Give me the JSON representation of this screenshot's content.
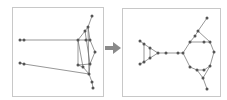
{
  "figure": {
    "colors": {
      "edge": "#6a6a6a",
      "node": "#555555",
      "border": "#c8c8c8",
      "arrow": "#8a8a8a"
    }
  },
  "arrow": {
    "icon": "right-arrow-icon"
  },
  "before": {
    "nodes": [
      {
        "x": 92,
        "y": 16
      },
      {
        "x": 88,
        "y": 27
      },
      {
        "x": 85,
        "y": 31
      },
      {
        "x": 78,
        "y": 40
      },
      {
        "x": 86,
        "y": 40
      },
      {
        "x": 90,
        "y": 40
      },
      {
        "x": 95,
        "y": 52
      },
      {
        "x": 78,
        "y": 65
      },
      {
        "x": 83,
        "y": 67
      },
      {
        "x": 90,
        "y": 64
      },
      {
        "x": 89,
        "y": 74
      },
      {
        "x": 92,
        "y": 82
      },
      {
        "x": 93,
        "y": 88
      },
      {
        "x": 20,
        "y": 40
      },
      {
        "x": 24,
        "y": 40
      },
      {
        "x": 20,
        "y": 63
      },
      {
        "x": 24,
        "y": 64
      }
    ],
    "edges": [
      [
        0,
        1
      ],
      [
        1,
        2
      ],
      [
        2,
        3
      ],
      [
        1,
        5
      ],
      [
        3,
        4
      ],
      [
        4,
        5
      ],
      [
        5,
        6
      ],
      [
        6,
        9
      ],
      [
        9,
        10
      ],
      [
        3,
        8
      ],
      [
        2,
        9
      ],
      [
        3,
        7
      ],
      [
        7,
        8
      ],
      [
        8,
        10
      ],
      [
        1,
        10
      ],
      [
        10,
        11
      ],
      [
        11,
        12
      ],
      [
        7,
        9
      ],
      [
        13,
        14
      ],
      [
        14,
        3
      ],
      [
        15,
        16
      ],
      [
        16,
        10
      ]
    ]
  },
  "after": {
    "nodes": [
      {
        "x": 140,
        "y": 41
      },
      {
        "x": 144,
        "y": 44
      },
      {
        "x": 150,
        "y": 48
      },
      {
        "x": 150,
        "y": 58
      },
      {
        "x": 144,
        "y": 62
      },
      {
        "x": 140,
        "y": 64
      },
      {
        "x": 158,
        "y": 53
      },
      {
        "x": 166,
        "y": 53
      },
      {
        "x": 178,
        "y": 53
      },
      {
        "x": 183,
        "y": 53
      },
      {
        "x": 190,
        "y": 42
      },
      {
        "x": 195,
        "y": 36
      },
      {
        "x": 198,
        "y": 31
      },
      {
        "x": 207,
        "y": 18
      },
      {
        "x": 204,
        "y": 42
      },
      {
        "x": 210,
        "y": 42
      },
      {
        "x": 214,
        "y": 52
      },
      {
        "x": 190,
        "y": 67
      },
      {
        "x": 197,
        "y": 70
      },
      {
        "x": 204,
        "y": 70
      },
      {
        "x": 210,
        "y": 66
      },
      {
        "x": 203,
        "y": 78
      },
      {
        "x": 207,
        "y": 89
      }
    ],
    "edges": [
      [
        0,
        1
      ],
      [
        1,
        2
      ],
      [
        1,
        4
      ],
      [
        2,
        6
      ],
      [
        2,
        3
      ],
      [
        3,
        6
      ],
      [
        3,
        4
      ],
      [
        4,
        5
      ],
      [
        6,
        7
      ],
      [
        7,
        8
      ],
      [
        8,
        9
      ],
      [
        9,
        10
      ],
      [
        10,
        11
      ],
      [
        11,
        12
      ],
      [
        12,
        13
      ],
      [
        10,
        14
      ],
      [
        14,
        15
      ],
      [
        12,
        15
      ],
      [
        15,
        16
      ],
      [
        16,
        20
      ],
      [
        9,
        17
      ],
      [
        17,
        18
      ],
      [
        18,
        19
      ],
      [
        19,
        20
      ],
      [
        18,
        21
      ],
      [
        20,
        21
      ],
      [
        21,
        22
      ]
    ]
  }
}
